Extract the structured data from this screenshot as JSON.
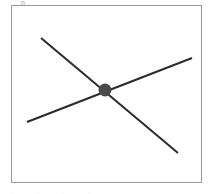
{
  "figure": {
    "title": "",
    "background_color": "#ffffff",
    "frame": {
      "x": 11,
      "y": 5,
      "width": 191,
      "height": 178,
      "border_color": "#9a9a9a",
      "border_width": 1,
      "fill_color": "#ffffff"
    },
    "artifacts": {
      "top_glyph": "n",
      "bottom_text": ". . . ."
    }
  },
  "chart_data": {
    "type": "scatter",
    "title": "",
    "xlabel": "",
    "ylabel": "",
    "xlim": [
      11,
      202
    ],
    "ylim": [
      5,
      183
    ],
    "grid": false,
    "legend": null,
    "series": [
      {
        "name": "line-descending",
        "type": "line",
        "color": "#2b2b2b",
        "width": 2,
        "x": [
          41,
          178
        ],
        "y": [
          38,
          153
        ]
      },
      {
        "name": "line-ascending",
        "type": "line",
        "color": "#2b2b2b",
        "width": 2,
        "x": [
          27,
          192
        ],
        "y": [
          122,
          58
        ]
      }
    ],
    "points": [
      {
        "name": "intersection-marker",
        "x": 105,
        "y": 90,
        "radius": 6.5,
        "color": "#4a4a4a"
      }
    ]
  }
}
